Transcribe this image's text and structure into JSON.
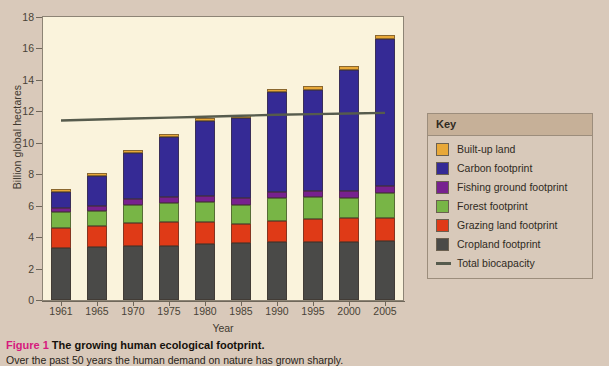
{
  "figure": {
    "number_label": "Figure 1",
    "title": "The growing human ecological footprint.",
    "subtitle": "Over the past 50 years the human demand on nature has grown sharply."
  },
  "axes": {
    "y_title": "Billion global hectares",
    "x_title": "Year",
    "y_ticks": [
      "0",
      "2",
      "4",
      "6",
      "8",
      "10",
      "12",
      "14",
      "16",
      "18"
    ],
    "x_ticks": [
      "1961",
      "1965",
      "1970",
      "1975",
      "1980",
      "1985",
      "1990",
      "1995",
      "2000",
      "2005"
    ]
  },
  "legend": {
    "title": "Key",
    "items": [
      {
        "label": "Built-up land",
        "color": "#e8a838",
        "type": "swatch"
      },
      {
        "label": "Carbon footprint",
        "color": "#352a95",
        "type": "swatch"
      },
      {
        "label": "Fishing ground footprint",
        "color": "#77218f",
        "type": "swatch"
      },
      {
        "label": "Forest footprint",
        "color": "#78b546",
        "type": "swatch"
      },
      {
        "label": "Grazing land footprint",
        "color": "#df3a17",
        "type": "swatch"
      },
      {
        "label": "Cropland  footprint",
        "color": "#4a4a48",
        "type": "swatch"
      },
      {
        "label": "Total biocapacity",
        "color": "#565b4d",
        "type": "line"
      }
    ]
  },
  "colors": {
    "plot_background": "#faf3dc",
    "page_background": "#d9c9ba",
    "axis": "#6f675a",
    "caption_accent": "#d6197d"
  },
  "chart_data": {
    "type": "bar",
    "stacked": true,
    "title": "The growing human ecological footprint.",
    "xlabel": "Year",
    "ylabel": "Billion global hectares",
    "ylim": [
      0,
      18
    ],
    "ytick_step": 2,
    "grid": false,
    "legend_position": "right",
    "categories": [
      "1961",
      "1965",
      "1970",
      "1975",
      "1980",
      "1985",
      "1990",
      "1995",
      "2000",
      "2005"
    ],
    "series": [
      {
        "name": "Cropland  footprint",
        "color": "#4a4a48",
        "values": [
          3.3,
          3.35,
          3.45,
          3.42,
          3.58,
          3.62,
          3.66,
          3.7,
          3.72,
          3.78
        ]
      },
      {
        "name": "Grazing land footprint",
        "color": "#df3a17",
        "values": [
          1.3,
          1.38,
          1.42,
          1.52,
          1.4,
          1.22,
          1.38,
          1.45,
          1.48,
          1.42
        ]
      },
      {
        "name": "Forest footprint",
        "color": "#78b546",
        "values": [
          1.0,
          0.92,
          1.2,
          1.22,
          1.28,
          1.22,
          1.46,
          1.38,
          1.32,
          1.6
        ]
      },
      {
        "name": "Fishing ground footprint",
        "color": "#77218f",
        "values": [
          0.25,
          0.3,
          0.35,
          0.38,
          0.38,
          0.4,
          0.4,
          0.4,
          0.42,
          0.45
        ]
      },
      {
        "name": "Carbon footprint",
        "color": "#352a95",
        "values": [
          1.05,
          1.95,
          2.95,
          3.85,
          4.75,
          5.1,
          6.3,
          6.45,
          7.7,
          9.35
        ]
      },
      {
        "name": "Built-up land",
        "color": "#e8a838",
        "values": [
          0.15,
          0.17,
          0.18,
          0.19,
          0.2,
          0.21,
          0.22,
          0.23,
          0.24,
          0.28
        ]
      }
    ],
    "totals": [
      7.05,
      8.07,
      9.55,
      10.58,
      11.59,
      11.77,
      13.42,
      13.61,
      14.88,
      16.88
    ],
    "overlay_line": {
      "name": "Total biocapacity",
      "color": "#565b4d",
      "values": [
        11.42,
        11.48,
        11.54,
        11.6,
        11.66,
        11.72,
        11.78,
        11.82,
        11.86,
        11.9
      ]
    }
  }
}
